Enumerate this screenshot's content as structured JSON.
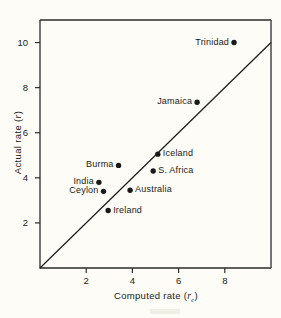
{
  "chart_data": {
    "type": "scatter",
    "title": "",
    "xlabel": "Computed rate (rc)",
    "ylabel": "Actual rate (r)",
    "xlabel_text": "Computed rate (",
    "xlabel_var": "r",
    "xlabel_sub": "c",
    "xlabel_tail": ")",
    "ylabel_text": "Actual rate (",
    "ylabel_var": "r",
    "ylabel_tail": ")",
    "xlim": [
      0,
      10
    ],
    "ylim": [
      0,
      11
    ],
    "xticks": [
      2,
      4,
      6,
      8
    ],
    "yticks": [
      2,
      4,
      6,
      8,
      10
    ],
    "grid": false,
    "legend": "none",
    "reference_line": {
      "description": "identity line y = x",
      "from": [
        0,
        0
      ],
      "to": [
        10,
        10
      ]
    },
    "points": [
      {
        "label": "Trinidad",
        "x": 8.4,
        "y": 10.0,
        "label_side": "left"
      },
      {
        "label": "Jamaica",
        "x": 6.8,
        "y": 7.35,
        "label_side": "left"
      },
      {
        "label": "Iceland",
        "x": 5.1,
        "y": 5.05,
        "label_side": "right"
      },
      {
        "label": "S. Africa",
        "x": 4.9,
        "y": 4.3,
        "label_side": "right"
      },
      {
        "label": "Burma",
        "x": 3.4,
        "y": 4.55,
        "label_side": "left"
      },
      {
        "label": "India",
        "x": 2.55,
        "y": 3.8,
        "label_side": "left"
      },
      {
        "label": "Ceylon",
        "x": 2.75,
        "y": 3.4,
        "label_side": "left"
      },
      {
        "label": "Australia",
        "x": 3.9,
        "y": 3.45,
        "label_side": "right"
      },
      {
        "label": "Ireland",
        "x": 2.95,
        "y": 2.55,
        "label_side": "right"
      }
    ]
  },
  "colors": {
    "background": "#fdfcf7",
    "ink": "#1a1a1a",
    "axis": "#2b2b2b"
  }
}
